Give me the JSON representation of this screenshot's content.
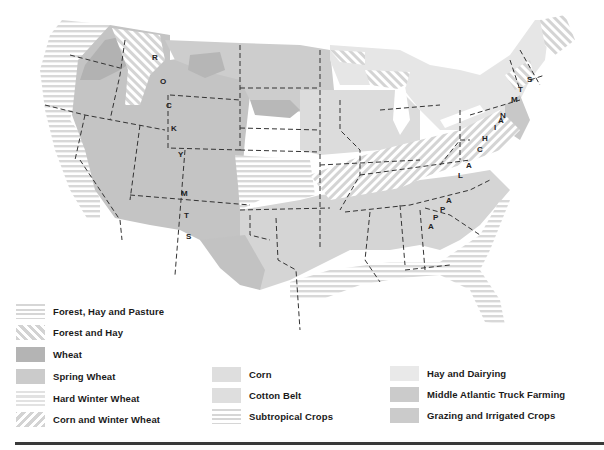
{
  "map": {
    "title": "Agricultural regions of the United States",
    "mountain_labels": {
      "rockies": [
        "R",
        "O",
        "C",
        "K",
        "Y",
        "M",
        "T",
        "S"
      ],
      "appalachians": [
        "A",
        "P",
        "P",
        "A",
        "L",
        "A",
        "C",
        "H",
        "I",
        "A",
        "N",
        "M",
        "T",
        "S"
      ]
    },
    "colors": {
      "wheat": "#b4b4b4",
      "spring_wheat": "#cbcbcb",
      "grazing": "#c4c4c4",
      "corn": "#dcdcdc",
      "cotton": "#d4d4d4",
      "hay_dairying": "#e6e6e6",
      "truck_farming": "#c8c8c8",
      "pattern_gray": "#d3d3d3",
      "border": "#333333"
    }
  },
  "legend": {
    "column1": [
      {
        "label": "Forest, Hay and Pasture",
        "pattern": "horizontal-lines"
      },
      {
        "label": "Forest and Hay",
        "pattern": "diagonal-back"
      },
      {
        "label": "Wheat",
        "pattern": "solid-dark"
      },
      {
        "label": "Spring Wheat",
        "pattern": "solid-mid"
      },
      {
        "label": "Hard Winter Wheat",
        "pattern": "horizontal-lines-light"
      },
      {
        "label": "Corn and Winter Wheat",
        "pattern": "diagonal-forward"
      }
    ],
    "column2": [
      {
        "label": "Corn",
        "pattern": "solid-light"
      },
      {
        "label": "Cotton Belt",
        "pattern": "solid-light"
      },
      {
        "label": "Subtropical Crops",
        "pattern": "horizontal-lines"
      }
    ],
    "column3": [
      {
        "label": "Hay and Dairying",
        "pattern": "solid-very-light"
      },
      {
        "label": "Middle Atlantic Truck Farming",
        "pattern": "solid-mid"
      },
      {
        "label": "Grazing and Irrigated Crops",
        "pattern": "solid-mid"
      }
    ]
  }
}
